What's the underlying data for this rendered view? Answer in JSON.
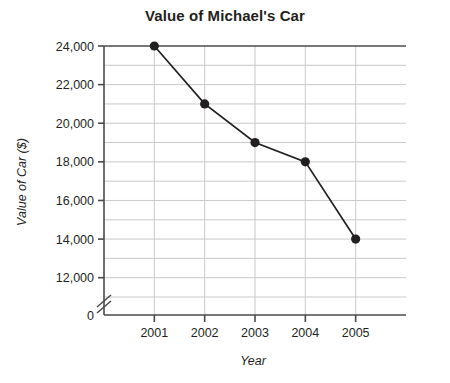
{
  "chart_data": {
    "type": "line",
    "title": "Value of Michael's Car",
    "xlabel": "Year",
    "ylabel": "Value of Car ($)",
    "categories": [
      "2001",
      "2002",
      "2003",
      "2004",
      "2005"
    ],
    "values": [
      24000,
      21000,
      19000,
      18000,
      14000
    ],
    "series": [
      {
        "name": "Value of Car ($)",
        "values": [
          24000,
          21000,
          19000,
          18000,
          14000
        ]
      }
    ],
    "x": [
      2001,
      2002,
      2003,
      2004,
      2005
    ],
    "ylim": [
      11000,
      24000
    ],
    "y_axis_break": true,
    "y_axis_zero_label": "0",
    "y_major_ticks": [
      12000,
      14000,
      16000,
      18000,
      20000,
      22000,
      24000
    ],
    "y_major_tick_labels": [
      "12,000",
      "14,000",
      "16,000",
      "18,000",
      "20,000",
      "22,000",
      "24,000"
    ],
    "y_minor_gridlines": [
      11000,
      13000,
      15000,
      17000,
      19000,
      21000,
      23000
    ],
    "y_tick_interval": 1000,
    "x_tick_labels": [
      "2001",
      "2002",
      "2003",
      "2004",
      "2005"
    ],
    "grid": true,
    "legend": "none",
    "line_color": "#231f20",
    "marker": "circle",
    "marker_color": "#231f20",
    "grid_color": "#c9c9cc",
    "axis_color": "#4a4a4c",
    "background": "#ffffff",
    "data_labels": [
      {
        "x": "2001",
        "y": 24000
      },
      {
        "x": "2002",
        "y": 21000
      },
      {
        "x": "2003",
        "y": 19000
      },
      {
        "x": "2004",
        "y": 18000
      },
      {
        "x": "2005",
        "y": 14000
      }
    ]
  }
}
